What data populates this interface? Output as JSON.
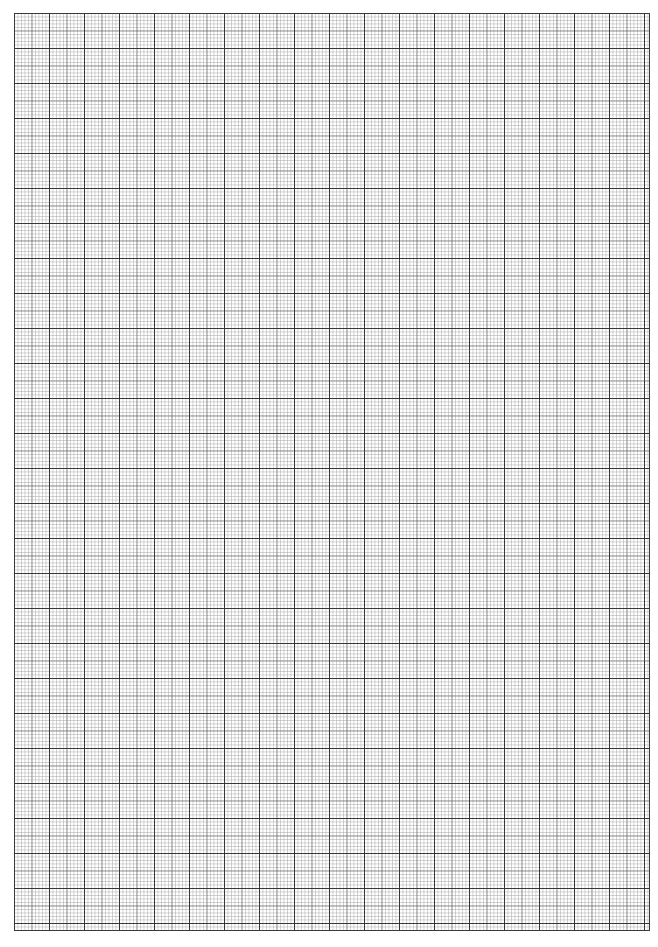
{
  "page": {
    "type": "graph-paper",
    "width_px": 658,
    "height_px": 947
  },
  "grid": {
    "major_spacing_px": 35,
    "medium_spacing_px": 17.5,
    "minor_spacing_px": 3.5,
    "major_columns": 18,
    "major_rows": 26,
    "line_color_major": "#282828",
    "line_color_medium": "#5a5a5a",
    "line_color_minor": "#969696",
    "border_color": "#3a3a3a",
    "background_color": "#ffffff"
  }
}
